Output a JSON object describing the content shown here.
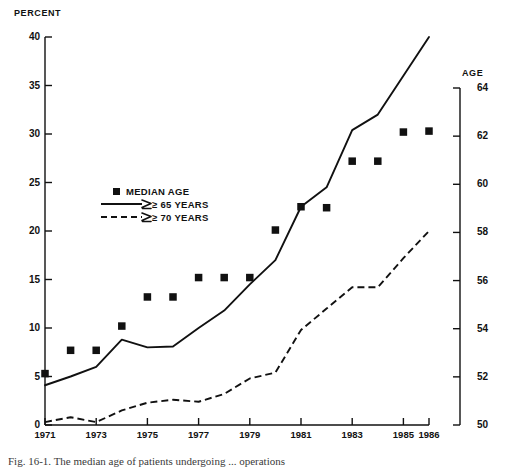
{
  "figure": {
    "caption": "Fig. 16-1.  The median age of patients undergoing ... operations",
    "left_axis_title": "PERCENT",
    "right_axis_title": "AGE"
  },
  "legend": {
    "items": [
      {
        "label": "MEDIAN AGE",
        "marker": "square-marker",
        "color": "#111111"
      },
      {
        "label": "≥ 65  YEARS",
        "marker": "solid-line",
        "color": "#111111"
      },
      {
        "label": "≥ 70 YEARS",
        "marker": "dashed-line",
        "color": "#111111"
      }
    ]
  },
  "chart_data": {
    "type": "line",
    "title": "",
    "xlabel": "",
    "ylabel": "PERCENT",
    "y2label": "AGE",
    "grid": false,
    "legend_position": "center-left",
    "x": [
      1971,
      1972,
      1973,
      1974,
      1975,
      1976,
      1977,
      1978,
      1979,
      1980,
      1981,
      1982,
      1983,
      1984,
      1985,
      1986
    ],
    "xlim": [
      1971,
      1986
    ],
    "xticks": [
      1971,
      1973,
      1975,
      1977,
      1979,
      1981,
      1983,
      1985,
      1986
    ],
    "xticklabels": [
      "1971",
      "1973",
      "1975",
      "1977",
      "1979",
      "1981",
      "1983",
      "1985",
      "1986"
    ],
    "ylim": [
      0,
      40
    ],
    "yticks": [
      0,
      5,
      10,
      15,
      20,
      25,
      30,
      35,
      40
    ],
    "yticklabels": [
      "0",
      "5",
      "10",
      "15",
      "20",
      "25",
      "30",
      "35",
      "40"
    ],
    "y2lim": [
      50,
      64
    ],
    "y2ticks": [
      50,
      52,
      54,
      56,
      58,
      60,
      62,
      64
    ],
    "y2ticklabels": [
      "50",
      "52",
      "54",
      "56",
      "58",
      "60",
      "62",
      "64"
    ],
    "series": [
      {
        "name": "MEDIAN AGE",
        "type": "scatter",
        "axis": "right",
        "marker": "square",
        "color": "#111111",
        "values_age": [
          51.9,
          52.7,
          52.7,
          53.6,
          54.6,
          54.6,
          55.3,
          55.3,
          55.3,
          57.0,
          57.9,
          57.8,
          59.5,
          59.5,
          60.6,
          60.6
        ],
        "values_percent_position": [
          5.3,
          7.7,
          7.7,
          10.2,
          13.2,
          13.2,
          15.2,
          15.2,
          15.2,
          20.1,
          22.5,
          22.4,
          27.2,
          27.2,
          30.2,
          30.3
        ]
      },
      {
        "name": "≥ 65  YEARS",
        "type": "line",
        "style": "solid",
        "axis": "left",
        "color": "#111111",
        "values": [
          4.1,
          5.0,
          6.0,
          8.8,
          8.0,
          8.1,
          10.0,
          11.8,
          14.5,
          17.0,
          22.5,
          24.5,
          30.4,
          32.0,
          36.0,
          40.0
        ]
      },
      {
        "name": "≥ 70 YEARS",
        "type": "line",
        "style": "dashed",
        "axis": "left",
        "color": "#111111",
        "values": [
          0.3,
          0.8,
          0.3,
          1.5,
          2.3,
          2.6,
          2.4,
          3.2,
          4.8,
          5.4,
          9.8,
          12.0,
          14.2,
          14.2,
          17.2,
          20.0
        ]
      }
    ]
  }
}
